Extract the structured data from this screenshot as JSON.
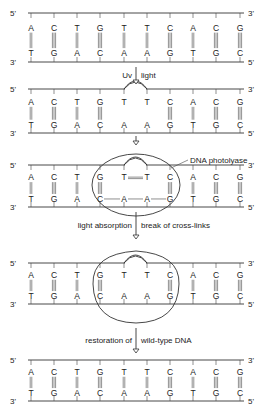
{
  "strand_ends": {
    "top_left": "5'",
    "top_right": "3'",
    "bottom_left": "3'",
    "bottom_right": "5'"
  },
  "top_strand": [
    "A",
    "C",
    "T",
    "G",
    "T",
    "T",
    "C",
    "A",
    "C",
    "G"
  ],
  "bottom_strand": [
    "T",
    "G",
    "A",
    "C",
    "A",
    "A",
    "G",
    "T",
    "G",
    "C"
  ],
  "bond_types": [
    "double",
    "triple",
    "double",
    "triple",
    "double",
    "double",
    "triple",
    "double",
    "triple",
    "triple"
  ],
  "panels": [
    {
      "id": "native",
      "state": "intact"
    },
    {
      "id": "dimer",
      "state": "thymine dimer formed"
    },
    {
      "id": "enzyme-bound",
      "state": "photolyase bound"
    },
    {
      "id": "cleaved",
      "state": "cross-links broken"
    },
    {
      "id": "restored",
      "state": "wild-type"
    }
  ],
  "steps": [
    {
      "left": "Uv",
      "right": "light"
    },
    {
      "left": "",
      "right": ""
    },
    {
      "left": "light absorption",
      "right": "break of cross-links"
    },
    {
      "left": "restoration of",
      "right": "wild-type DNA"
    }
  ],
  "enzyme_label": "DNA  photolyase",
  "dimer_bond": "T=T",
  "colors": {
    "line": "#333333",
    "text": "#222222",
    "background": "#ffffff"
  }
}
